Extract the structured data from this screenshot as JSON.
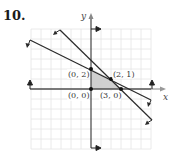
{
  "problem_number": "10.",
  "axes": {
    "x_label": "x",
    "y_label": "y"
  },
  "points": [
    {
      "label": "(0, 2)",
      "x": 0,
      "y": 2
    },
    {
      "label": "(2, 1)",
      "x": 2,
      "y": 1
    },
    {
      "label": "(0, 0)",
      "x": 0,
      "y": 0
    },
    {
      "label": "(3, 0)",
      "x": 3,
      "y": 0
    }
  ],
  "lines": [
    {
      "name": "x + 2y = 4",
      "slope": -0.5,
      "intercept": 2
    },
    {
      "name": "x + y = 3",
      "slope": -1,
      "intercept": 3
    }
  ],
  "feasible_region": [
    [
      0,
      0
    ],
    [
      0,
      2
    ],
    [
      2,
      1
    ],
    [
      3,
      0
    ]
  ],
  "colors": {
    "shade": "#c8c8c8",
    "line": "#2a2a2a",
    "grid": "#e2e2e2"
  }
}
